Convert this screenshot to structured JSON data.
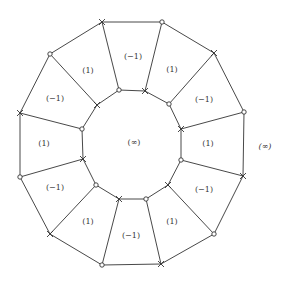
{
  "diagram": {
    "colors": {
      "stroke": "#333333",
      "background": "#ffffff",
      "text": "#333333"
    },
    "outer_vertices": [
      {
        "x": 102,
        "y": 22,
        "marker": "cross"
      },
      {
        "x": 162,
        "y": 22,
        "marker": "circle"
      },
      {
        "x": 214,
        "y": 53,
        "marker": "cross"
      },
      {
        "x": 244,
        "y": 112,
        "marker": "circle"
      },
      {
        "x": 243,
        "y": 176,
        "marker": "cross"
      },
      {
        "x": 214,
        "y": 234,
        "marker": "circle"
      },
      {
        "x": 161,
        "y": 264,
        "marker": "cross"
      },
      {
        "x": 102,
        "y": 265,
        "marker": "circle"
      },
      {
        "x": 50,
        "y": 234,
        "marker": "cross"
      },
      {
        "x": 20,
        "y": 177,
        "marker": "circle"
      },
      {
        "x": 20,
        "y": 113,
        "marker": "cross"
      },
      {
        "x": 50,
        "y": 54,
        "marker": "circle"
      }
    ],
    "inner_vertices": [
      {
        "x": 119,
        "y": 90,
        "marker": "circle"
      },
      {
        "x": 145,
        "y": 91,
        "marker": "cross"
      },
      {
        "x": 169,
        "y": 104,
        "marker": "circle"
      },
      {
        "x": 181,
        "y": 129,
        "marker": "cross"
      },
      {
        "x": 181,
        "y": 160,
        "marker": "circle"
      },
      {
        "x": 168,
        "y": 185,
        "marker": "cross"
      },
      {
        "x": 146,
        "y": 199,
        "marker": "circle"
      },
      {
        "x": 119,
        "y": 199,
        "marker": "cross"
      },
      {
        "x": 96,
        "y": 185,
        "marker": "circle"
      },
      {
        "x": 83,
        "y": 159,
        "marker": "cross"
      },
      {
        "x": 82,
        "y": 129,
        "marker": "circle"
      },
      {
        "x": 97,
        "y": 105,
        "marker": "cross"
      }
    ],
    "spokes": [
      {
        "outer": 0,
        "inner": 0
      },
      {
        "outer": 1,
        "inner": 1
      },
      {
        "outer": 2,
        "inner": 2
      },
      {
        "outer": 3,
        "inner": 3
      },
      {
        "outer": 4,
        "inner": 4
      },
      {
        "outer": 5,
        "inner": 5
      },
      {
        "outer": 6,
        "inner": 6
      },
      {
        "outer": 7,
        "inner": 7
      },
      {
        "outer": 8,
        "inner": 8
      },
      {
        "outer": 9,
        "inner": 9
      },
      {
        "outer": 10,
        "inner": 10
      },
      {
        "outer": 11,
        "inner": 11
      }
    ],
    "face_labels": [
      {
        "text": "(−1)",
        "x": 133,
        "y": 57
      },
      {
        "text": "(1)",
        "x": 172,
        "y": 70
      },
      {
        "text": "(−1)",
        "x": 204,
        "y": 100
      },
      {
        "text": "(1)",
        "x": 208,
        "y": 144
      },
      {
        "text": "(−1)",
        "x": 204,
        "y": 190
      },
      {
        "text": "(1)",
        "x": 172,
        "y": 222
      },
      {
        "text": "(−1)",
        "x": 131,
        "y": 236
      },
      {
        "text": "(1)",
        "x": 88,
        "y": 222
      },
      {
        "text": "(−1)",
        "x": 55,
        "y": 188
      },
      {
        "text": "(1)",
        "x": 44,
        "y": 144
      },
      {
        "text": "(−1)",
        "x": 55,
        "y": 99
      },
      {
        "text": "(1)",
        "x": 88,
        "y": 71
      }
    ],
    "inner_region_label": {
      "text": "(∞)",
      "x": 134,
      "y": 143
    },
    "outer_region_label": {
      "text": "(∞)",
      "x": 265,
      "y": 147
    }
  }
}
